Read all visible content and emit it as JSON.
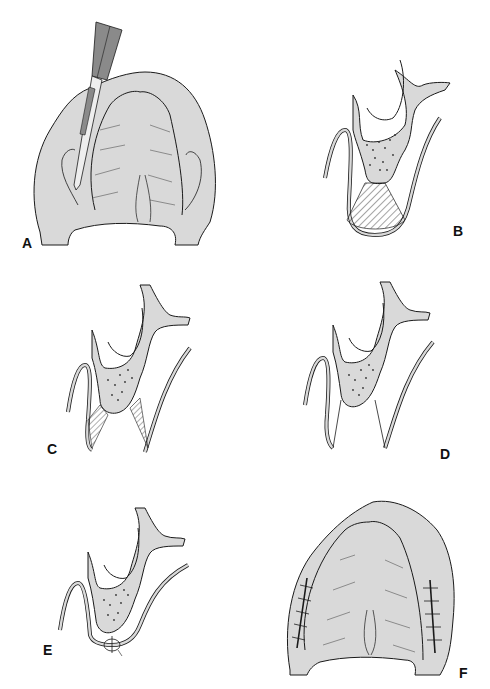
{
  "figure": {
    "panels": [
      {
        "id": "A",
        "label": "A",
        "description": "Palate viewed from below with scalpel making incision along the lateral ridge"
      },
      {
        "id": "B",
        "label": "B",
        "description": "Cross-section of alveolar ridge with hatched triangular region at base of ridge"
      },
      {
        "id": "C",
        "label": "C",
        "description": "Cross-section with hatched wedge areas on both sides of the ridge"
      },
      {
        "id": "D",
        "label": "D",
        "description": "Cross-section after wedge excision, ridge narrowed"
      },
      {
        "id": "E",
        "label": "E",
        "description": "Cross-section with suture closing the wound at the base of the ridge"
      },
      {
        "id": "F",
        "label": "F",
        "description": "Palate viewed from below with sutured incisions on both lateral ridges"
      }
    ]
  },
  "colors": {
    "tissue": "#d9d9d9",
    "line": "#1a1a1a",
    "instrument": "#8a8a8a",
    "background": "#ffffff"
  }
}
